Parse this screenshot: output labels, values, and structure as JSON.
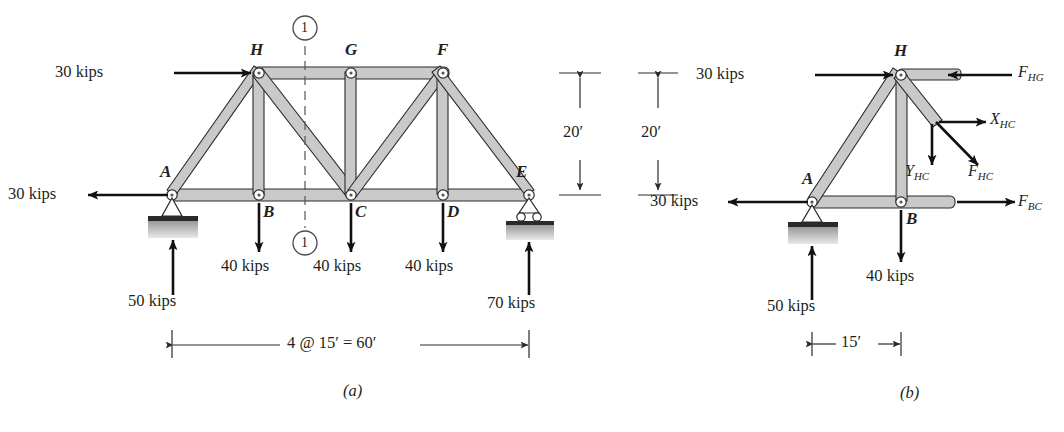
{
  "figure": {
    "panels": [
      {
        "caption": "(a)",
        "name": "full-truss"
      },
      {
        "caption": "(b)",
        "name": "free-body-left-segment"
      }
    ]
  },
  "panel_a": {
    "caption": "(a)",
    "joints": [
      {
        "id": "A",
        "label": "A"
      },
      {
        "id": "B",
        "label": "B"
      },
      {
        "id": "C",
        "label": "C"
      },
      {
        "id": "D",
        "label": "D"
      },
      {
        "id": "E",
        "label": "E"
      },
      {
        "id": "F",
        "label": "F"
      },
      {
        "id": "G",
        "label": "G"
      },
      {
        "id": "H",
        "label": "H"
      }
    ],
    "loads": {
      "top_left_horizontal": "30 kips",
      "left_horizontal": "30 kips",
      "joint_B": "40 kips",
      "joint_C": "40 kips",
      "joint_D": "40 kips"
    },
    "reactions": {
      "support_A": "50 kips",
      "support_E": "70 kips"
    },
    "section_marks": {
      "top": "1",
      "bottom": "1"
    },
    "dimensions": {
      "span": "4 @ 15′ = 60′",
      "height": "20′"
    }
  },
  "panel_b": {
    "caption": "(b)",
    "joints": [
      {
        "id": "A",
        "label": "A"
      },
      {
        "id": "B",
        "label": "B"
      },
      {
        "id": "H",
        "label": "H"
      }
    ],
    "loads": {
      "top_horizontal": "30 kips",
      "left_horizontal": "30 kips",
      "joint_B": "40 kips"
    },
    "reactions": {
      "support_A": "50 kips"
    },
    "member_forces": [
      {
        "symbol": "F",
        "sub": "HG"
      },
      {
        "symbol": "X",
        "sub": "HC"
      },
      {
        "symbol": "Y",
        "sub": "HC"
      },
      {
        "symbol": "F",
        "sub": "HC"
      },
      {
        "symbol": "F",
        "sub": "BC"
      }
    ],
    "dimensions": {
      "height": "20′",
      "width": "15′"
    }
  },
  "colors": {
    "member_fill": "#c9c9c9",
    "outline": "#2a2a2a",
    "arrow": "#111111",
    "background": "#ffffff",
    "ground_hatch": "#b9b9b9"
  }
}
